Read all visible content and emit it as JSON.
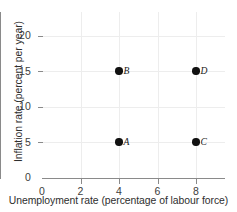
{
  "chart_data": {
    "type": "scatter",
    "title": "",
    "subtitle": "",
    "xlabel": "Unemployment rate (percentage of labour force)",
    "ylabel": "Inflation rate (percent per year)",
    "xlim": [
      0,
      9.5
    ],
    "ylim": [
      0,
      23.4
    ],
    "xticks": [
      0,
      2,
      4,
      6,
      8
    ],
    "xtick_labels": [
      "0",
      "2",
      "4",
      "6",
      "8"
    ],
    "yticks": [
      0,
      5,
      10,
      15,
      20
    ],
    "ytick_labels": [
      "0",
      "5",
      "10",
      "15",
      "20"
    ],
    "grid": true,
    "grid_color": "#ededed",
    "axis_color": "#8a8a8a",
    "legend": null,
    "legend_position": "none",
    "marker_color": "#111111",
    "points": [
      {
        "label": "A",
        "x": 4,
        "y": 5
      },
      {
        "label": "B",
        "x": 4,
        "y": 15
      },
      {
        "label": "C",
        "x": 8,
        "y": 5
      },
      {
        "label": "D",
        "x": 8,
        "y": 15
      }
    ],
    "annotations": [
      {
        "text": "A",
        "x": 4,
        "y": 5
      },
      {
        "text": "B",
        "x": 4,
        "y": 15
      },
      {
        "text": "C",
        "x": 8,
        "y": 5
      },
      {
        "text": "D",
        "x": 8,
        "y": 15
      }
    ]
  }
}
